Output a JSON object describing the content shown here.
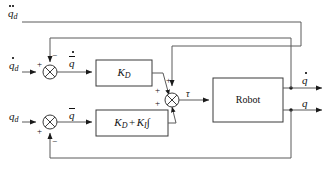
{
  "diagram": {
    "type": "control-block-diagram",
    "background": "#ffffff",
    "line_color": "#555555",
    "text_color": "#111111"
  },
  "inputs": [
    {
      "id": "qdd_d",
      "base": "q",
      "sub": "d",
      "accent": "double-dot",
      "label": "q̈d",
      "role": "acceleration-reference-feedforward",
      "y": 18
    },
    {
      "id": "qd_d",
      "base": "q",
      "sub": "d",
      "accent": "dot",
      "label": "q̇d",
      "role": "velocity-reference",
      "y": 72
    },
    {
      "id": "q_d",
      "base": "q",
      "sub": "d",
      "accent": "none",
      "label": "qd",
      "role": "position-reference",
      "y": 122
    }
  ],
  "errors": [
    {
      "id": "qbar_dot",
      "base": "q",
      "accent": "bar-dot",
      "label": "q̄̇",
      "role": "velocity-error"
    },
    {
      "id": "qbar",
      "base": "q",
      "accent": "bar",
      "label": "q̄",
      "role": "position-error"
    }
  ],
  "sum_junctions": [
    {
      "id": "sum-velocity",
      "cx": 50,
      "cy": 72,
      "r": 7,
      "signs": [
        {
          "port": "left",
          "sign": "+"
        },
        {
          "port": "top",
          "sign": "−"
        }
      ]
    },
    {
      "id": "sum-position",
      "cx": 50,
      "cy": 122,
      "r": 7,
      "signs": [
        {
          "port": "left",
          "sign": "+"
        },
        {
          "port": "bottom",
          "sign": "−"
        }
      ]
    },
    {
      "id": "sum-torque",
      "cx": 172,
      "cy": 100,
      "r": 7,
      "signs": [
        {
          "port": "top",
          "sign": "+"
        },
        {
          "port": "upper-left",
          "sign": "+"
        },
        {
          "port": "lower-left",
          "sign": "+"
        }
      ]
    }
  ],
  "blocks": [
    {
      "id": "kd-block",
      "label": "K_D",
      "base": "K",
      "sub": "D",
      "x": 96,
      "y": 60,
      "w": 56,
      "h": 26,
      "role": "derivative-gain"
    },
    {
      "id": "kd-ki-block",
      "label": "K_D + K_I∫",
      "parts": [
        {
          "base": "K",
          "sub": "D"
        },
        {
          "op": "+"
        },
        {
          "base": "K",
          "sub": "I"
        },
        {
          "op": "∫"
        }
      ],
      "x": 96,
      "y": 110,
      "w": 72,
      "h": 26,
      "role": "pi-gain"
    },
    {
      "id": "robot-block",
      "label": "Robot",
      "x": 213,
      "y": 78,
      "w": 70,
      "h": 44,
      "role": "plant"
    }
  ],
  "signals": {
    "torque": {
      "id": "tau",
      "label": "τ",
      "role": "control-torque",
      "x": 186,
      "y": 92
    }
  },
  "outputs": [
    {
      "id": "q_dot_out",
      "base": "q",
      "accent": "dot",
      "label": "q̇",
      "role": "measured-velocity",
      "y": 88
    },
    {
      "id": "q_out",
      "base": "q",
      "accent": "none",
      "label": "q",
      "role": "measured-position",
      "y": 110
    }
  ],
  "feedback": [
    {
      "id": "velocity-feedback",
      "from": "q_dot_out",
      "to": "sum-velocity",
      "port": "top",
      "sign": "−"
    },
    {
      "id": "position-feedback",
      "from": "q_out",
      "to": "sum-position",
      "port": "bottom",
      "sign": "−"
    },
    {
      "id": "acceleration-feedforward",
      "from": "qdd_d",
      "to": "sum-torque",
      "port": "top",
      "sign": "+"
    }
  ]
}
